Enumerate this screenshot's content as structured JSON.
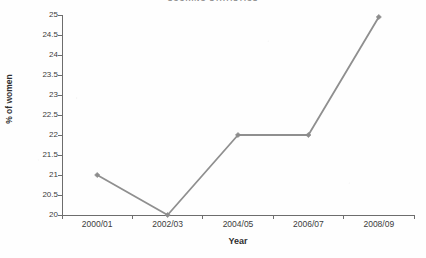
{
  "chart_data": {
    "type": "line",
    "title": "SCORING STATISTICS",
    "subtitle": "",
    "xlabel": "Year",
    "ylabel": "% of women",
    "categories": [
      "2000/01",
      "2002/03",
      "2004/05",
      "2006/07",
      "2008/09"
    ],
    "values": [
      21.0,
      20.0,
      22.0,
      22.0,
      24.95
    ],
    "series": [
      {
        "name": "% of women",
        "values": [
          21.0,
          20.0,
          22.0,
          22.0,
          24.95
        ]
      }
    ],
    "ylim": [
      20,
      25
    ],
    "ytick_step": 0.5,
    "ytick_labels": [
      "25",
      "24.5",
      "24",
      "23.5",
      "23",
      "22.5",
      "22",
      "21.5",
      "21",
      "20.5",
      "20"
    ],
    "ytick_values": [
      25,
      24.5,
      24,
      23.5,
      23,
      22.5,
      22,
      21.5,
      21,
      20.5,
      20
    ],
    "grid": false,
    "legend": false,
    "legend_position": "none",
    "marker": "diamond",
    "annotations": [],
    "colors": {
      "line": "#8f8f8f",
      "marker": "#8c8c8c",
      "axis": "#6d6d6d",
      "text": "#3c3c3c",
      "title": "#8d8d8d",
      "background": "#fefefe"
    }
  }
}
